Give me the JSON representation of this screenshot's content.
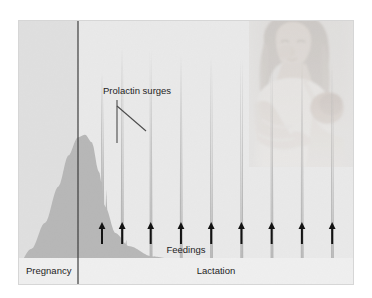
{
  "figure": {
    "frame": {
      "x": 18,
      "y": 20,
      "width": 336,
      "height": 265
    }
  },
  "annotations": {
    "prolactin_surges_label": "Prolactin surges",
    "feedings_label": "Feedings"
  },
  "phases": {
    "pregnancy_label": "Pregnancy",
    "lactation_label": "Lactation"
  },
  "photo": {
    "alt_name": "mother-breastfeeding-infant-photo",
    "x": 249,
    "y": 20,
    "width": 105,
    "height": 147
  },
  "colors": {
    "background": "#e9e9e9",
    "pregnancy_band": "#dedede",
    "curve_fill": "#b7b7b7",
    "curve_fill_light": "#c4c4c4",
    "divider": "#3c3c3c",
    "text": "#1c1c1c",
    "arrow": "#111111",
    "leader": "#4a4a4a",
    "label_band": "#efefef",
    "frame_edge": "#d2d2d2"
  },
  "chart_data": {
    "type": "area",
    "xlabel": "Time",
    "ylabel": "Blood prolactin concentration",
    "xlim": [
      0,
      100
    ],
    "ylim": [
      0,
      100
    ],
    "grid": false,
    "legend": null,
    "axis_ticks_shown": false,
    "phase_divider_x": 17.8,
    "series": [
      {
        "name": "Blood prolactin",
        "description": "Gradual rise through pregnancy to a broad peak near term, abrupt fall at parturition, then repeated sharp surges triggered by each suckling episode during lactation, superimposed on a slowly declining baseline.",
        "baseline_profile": [
          {
            "x": 0,
            "y": 8
          },
          {
            "x": 4,
            "y": 14
          },
          {
            "x": 8,
            "y": 24
          },
          {
            "x": 12,
            "y": 38
          },
          {
            "x": 15,
            "y": 50
          },
          {
            "x": 17.8,
            "y": 57
          },
          {
            "x": 20,
            "y": 58
          },
          {
            "x": 22,
            "y": 55
          },
          {
            "x": 24,
            "y": 44
          },
          {
            "x": 26,
            "y": 30
          },
          {
            "x": 29,
            "y": 20
          },
          {
            "x": 33,
            "y": 15
          },
          {
            "x": 40,
            "y": 11
          },
          {
            "x": 50,
            "y": 9
          },
          {
            "x": 60,
            "y": 8
          },
          {
            "x": 75,
            "y": 7
          },
          {
            "x": 90,
            "y": 6
          },
          {
            "x": 100,
            "y": 6
          }
        ],
        "surges": [
          {
            "index": 1,
            "x": 25.0,
            "peak_y": 82,
            "feeding": true
          },
          {
            "index": 2,
            "x": 31.0,
            "peak_y": 92,
            "feeding": true
          },
          {
            "index": 3,
            "x": 39.5,
            "peak_y": 91,
            "feeding": true
          },
          {
            "index": 4,
            "x": 48.5,
            "peak_y": 89,
            "feeding": true
          },
          {
            "index": 5,
            "x": 57.5,
            "peak_y": 88,
            "feeding": true
          },
          {
            "index": 6,
            "x": 66.5,
            "peak_y": 88,
            "feeding": true
          },
          {
            "index": 7,
            "x": 75.5,
            "peak_y": 87,
            "feeding": true
          },
          {
            "index": 8,
            "x": 84.5,
            "peak_y": 87,
            "feeding": true
          },
          {
            "index": 9,
            "x": 93.5,
            "peak_y": 86,
            "feeding": true
          }
        ]
      }
    ],
    "feeding_arrow_count": 9,
    "annotations": [
      {
        "text": "Prolactin surges",
        "target_surges": [
          2,
          3
        ]
      },
      {
        "text": "Feedings",
        "points_to": "feeding-arrows"
      },
      {
        "text": "Pregnancy",
        "region": "left-of-divider"
      },
      {
        "text": "Lactation",
        "region": "right-of-divider"
      }
    ]
  }
}
